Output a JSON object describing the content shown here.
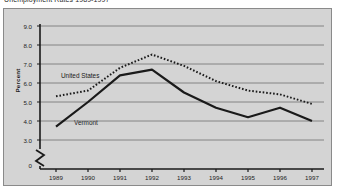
{
  "figure": {
    "title": "Unemployment Rates 1989-1997",
    "background_color": "#d4d4d4",
    "page_background": "#ffffff",
    "border_color": "#8a8a8a"
  },
  "chart_data": {
    "type": "line",
    "title": "Unemployment Rates 1989-1997",
    "xlabel": "",
    "ylabel": "Percent",
    "categories": [
      "1989",
      "1990",
      "1991",
      "1992",
      "1993",
      "1994",
      "1995",
      "1996",
      "1997"
    ],
    "ylim": [
      3.0,
      9.0
    ],
    "yticks": [
      "0",
      "3.0",
      "4.0",
      "5.0",
      "6.0",
      "7.0",
      "8.0",
      "9.0"
    ],
    "ytick_values": [
      3.0,
      4.0,
      5.0,
      6.0,
      7.0,
      8.0,
      9.0
    ],
    "y_axis_break": true,
    "y_axis_break_symbol": "zigzag",
    "grid": true,
    "grid_color": "#6e6e6e",
    "legend_position": "inline-labels",
    "series": [
      {
        "name": "United States",
        "style": "dotted",
        "color": "#1a1a1a",
        "label_x_year": "1990",
        "values": [
          5.3,
          5.6,
          6.8,
          7.5,
          6.9,
          6.1,
          5.6,
          5.4,
          4.9
        ]
      },
      {
        "name": "Vermont",
        "style": "solid",
        "color": "#1a1a1a",
        "label_x_year": "1990",
        "values": [
          3.7,
          5.0,
          6.4,
          6.7,
          5.5,
          4.7,
          4.2,
          4.7,
          4.0
        ]
      }
    ]
  },
  "labels": {
    "ylabel_text": "Percent",
    "series_us": "United States",
    "series_vt": "Vermont"
  }
}
